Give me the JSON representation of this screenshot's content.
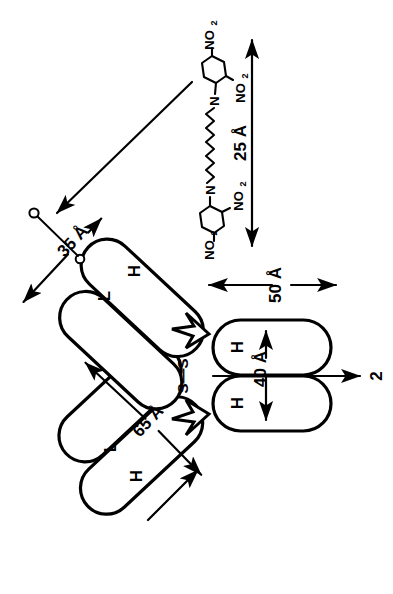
{
  "figure": {
    "background_color": "#ffffff",
    "line_color": "#000000",
    "orientation_note": "diagram rotated 90 degrees"
  },
  "domains": {
    "fab_upper_heavy_label": "H",
    "fab_upper_light_label": "L",
    "fab_lower_heavy_label": "H",
    "fab_lower_light_label": "L",
    "fc_upper_label": "H",
    "fc_lower_label": "H"
  },
  "hinge": {
    "disulfide_label": "S—S"
  },
  "dimensions": [
    {
      "id": "len-25",
      "value": "25 Å",
      "text": "25 Å",
      "number": 25,
      "unit": "Å",
      "orientation": "vertical"
    },
    {
      "id": "len-50",
      "value": "50 Å",
      "text": "50 Å",
      "number": 50,
      "unit": "Å",
      "orientation": "horizontal"
    },
    {
      "id": "len-40",
      "value": "40 Å",
      "text": "40 Å",
      "number": 40,
      "unit": "Å",
      "orientation": "vertical"
    },
    {
      "id": "len-65",
      "value": "65 Å",
      "text": "65 Å",
      "number": 65,
      "unit": "Å",
      "orientation": "diagonal"
    },
    {
      "id": "len-35",
      "value": "35 Å",
      "text": "35 Å",
      "number": 35,
      "unit": "Å",
      "orientation": "diagonal"
    }
  ],
  "symmetry_axis": {
    "label": "2",
    "description": "two-fold rotation axis"
  },
  "hapten": {
    "name": "bis-DNP ligand",
    "top_ring": {
      "substituent_1": "NO₂",
      "substituent_2": "NO₂",
      "linker_atom": "N"
    },
    "bottom_ring": {
      "substituent_1": "NO₂",
      "substituent_2": "NO₂",
      "linker_atom": "N"
    },
    "chain": "polymethylene zigzag chain"
  },
  "nitro_labels": {
    "main": "NO",
    "subscript": "2"
  },
  "nitrogen_label": "N"
}
